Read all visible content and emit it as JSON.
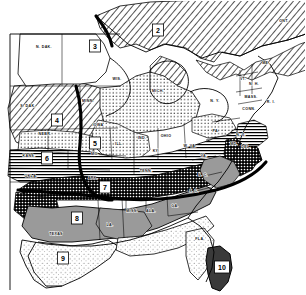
{
  "map": {
    "title": "Eastern and Central United States Zone Map",
    "background_color": "#ffffff",
    "ink_color": "#000000",
    "zones": [
      {
        "id": "2",
        "label": "2",
        "x": 158,
        "y": 30,
        "region": "southern-ontario-canada",
        "pattern": "diagonal-hatch"
      },
      {
        "id": "3",
        "label": "3",
        "x": 95,
        "y": 46,
        "region": "minnesota-wisconsin",
        "pattern": "blank-white"
      },
      {
        "id": "4",
        "label": "4",
        "x": 57,
        "y": 120,
        "region": "south-dakota-nebraska",
        "pattern": "diagonal-hatch"
      },
      {
        "id": "5",
        "label": "5",
        "x": 95,
        "y": 143,
        "region": "iowa-illinois",
        "pattern": "fine-dots"
      },
      {
        "id": "6",
        "label": "6",
        "x": 47,
        "y": 158,
        "region": "kansas-missouri",
        "pattern": "horizontal-lines"
      },
      {
        "id": "7",
        "label": "7",
        "x": 105,
        "y": 187,
        "region": "arkansas-tennessee",
        "pattern": "dense-checker"
      },
      {
        "id": "8",
        "label": "8",
        "x": 77,
        "y": 218,
        "region": "texas-gulf",
        "pattern": "solid-gray"
      },
      {
        "id": "9",
        "label": "9",
        "x": 63,
        "y": 258,
        "region": "south-texas",
        "pattern": "light-stipple"
      },
      {
        "id": "10",
        "label": "10",
        "x": 222,
        "y": 267,
        "region": "south-florida",
        "pattern": "dark-solid"
      }
    ],
    "state_labels": [
      {
        "text": "N. DAK.",
        "x": 44,
        "y": 48
      },
      {
        "text": "S. DAK.",
        "x": 28,
        "y": 107
      },
      {
        "text": "NEBR.",
        "x": 45,
        "y": 135
      },
      {
        "text": "MINN.",
        "x": 88,
        "y": 102
      },
      {
        "text": "IOWA",
        "x": 98,
        "y": 126
      },
      {
        "text": "WIS.",
        "x": 117,
        "y": 80
      },
      {
        "text": "MICH.",
        "x": 158,
        "y": 92
      },
      {
        "text": "KANS.",
        "x": 29,
        "y": 157
      },
      {
        "text": "OKLA.",
        "x": 31,
        "y": 177
      },
      {
        "text": "MO.",
        "x": 95,
        "y": 155
      },
      {
        "text": "ARK.",
        "x": 93,
        "y": 179
      },
      {
        "text": "TEXAS",
        "x": 56,
        "y": 235
      },
      {
        "text": "LA.",
        "x": 110,
        "y": 226
      },
      {
        "text": "MISS.",
        "x": 132,
        "y": 212
      },
      {
        "text": "ALA.",
        "x": 151,
        "y": 212
      },
      {
        "text": "GA.",
        "x": 175,
        "y": 207
      },
      {
        "text": "FLA.",
        "x": 200,
        "y": 240
      },
      {
        "text": "TENN.",
        "x": 146,
        "y": 172
      },
      {
        "text": "KY.",
        "x": 156,
        "y": 152
      },
      {
        "text": "ILL.",
        "x": 119,
        "y": 145
      },
      {
        "text": "IND.",
        "x": 142,
        "y": 139
      },
      {
        "text": "OHIO",
        "x": 166,
        "y": 137
      },
      {
        "text": "W. VA.",
        "x": 190,
        "y": 147
      },
      {
        "text": "VA.",
        "x": 204,
        "y": 157
      },
      {
        "text": "N. C.",
        "x": 203,
        "y": 176
      },
      {
        "text": "S. C.",
        "x": 194,
        "y": 192
      },
      {
        "text": "PA.",
        "x": 216,
        "y": 132
      },
      {
        "text": "N. Y.",
        "x": 215,
        "y": 102
      },
      {
        "text": "N. J.",
        "x": 241,
        "y": 136
      },
      {
        "text": "DEL.",
        "x": 246,
        "y": 148
      },
      {
        "text": "MD.",
        "x": 234,
        "y": 145
      },
      {
        "text": "MASS.",
        "x": 251,
        "y": 98
      },
      {
        "text": "CONN.",
        "x": 249,
        "y": 110
      },
      {
        "text": "R. I.",
        "x": 271,
        "y": 103
      },
      {
        "text": "VT.",
        "x": 243,
        "y": 80
      },
      {
        "text": "N. H.",
        "x": 254,
        "y": 85
      },
      {
        "text": "ME.",
        "x": 266,
        "y": 64
      },
      {
        "text": "ONT.",
        "x": 284,
        "y": 22
      }
    ]
  }
}
